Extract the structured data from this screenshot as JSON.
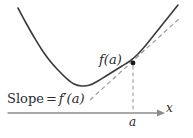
{
  "figure": {
    "width": 193,
    "height": 138,
    "background": "#ffffff",
    "curve_color": "#3a3a3a",
    "tangent_color": "#9a9a9a",
    "axis_color": "#8c8c8c",
    "dashed_drop_color": "#a0a0a0",
    "point_color": "#1a1a1a",
    "text_color": "#2b2b2b"
  },
  "labels": {
    "value_at_a": "f(a)",
    "slope_prefix": "Slope",
    "slope_equals": "=",
    "slope_value": "f′(a)",
    "slope_full": "Slope = f′(a)",
    "x_tick": "a",
    "axis_x": "x"
  },
  "chart_data": {
    "type": "line",
    "title": "",
    "subtitle": "",
    "xlabel": "x",
    "ylabel": "",
    "grid": false,
    "legend": null,
    "axis": {
      "x_axis_y_px": 113,
      "x_axis_start_px": 8,
      "x_axis_end_px": 162,
      "arrow": "right",
      "ticks": [
        {
          "label": "a",
          "x_px": 133
        }
      ]
    },
    "series": [
      {
        "name": "f(x)",
        "style": "solid",
        "color": "#3a3a3a",
        "description": "upward-opening parabola",
        "points_px": [
          [
            18,
            8
          ],
          [
            26,
            23
          ],
          [
            34,
            37
          ],
          [
            42,
            50
          ],
          [
            50,
            61
          ],
          [
            58,
            70
          ],
          [
            66,
            78
          ],
          [
            74,
            84
          ],
          [
            82,
            86
          ],
          [
            90,
            85
          ],
          [
            98,
            81
          ],
          [
            106,
            76
          ],
          [
            114,
            71
          ],
          [
            122,
            66
          ],
          [
            130,
            61
          ],
          [
            138,
            54
          ],
          [
            146,
            45
          ],
          [
            154,
            35
          ],
          [
            162,
            25
          ],
          [
            170,
            15
          ],
          [
            178,
            5
          ]
        ]
      },
      {
        "name": "tangent at a",
        "style": "dashed",
        "color": "#9a9a9a",
        "description": "tangent line touching curve at x = a with slope f'(a)",
        "points_px": [
          [
            90,
            100
          ],
          [
            181,
            17
          ]
        ]
      },
      {
        "name": "drop line at a",
        "style": "dashed",
        "color": "#a0a0a0",
        "description": "vertical dashed segment from tangent point down to x-axis",
        "points_px": [
          [
            133,
            66
          ],
          [
            133,
            113
          ]
        ]
      }
    ],
    "annotations": [
      {
        "text": "f(a)",
        "x_px": 99,
        "y_px": 53,
        "anchor": "left-top"
      },
      {
        "text": "Slope = f′(a)",
        "x_px": 7,
        "y_px": 92,
        "anchor": "left-top"
      },
      {
        "text": "a",
        "x_px": 129,
        "y_px": 116,
        "anchor": "left-top"
      },
      {
        "text": "x",
        "x_px": 166,
        "y_px": 102,
        "anchor": "left-top"
      }
    ],
    "markers": [
      {
        "name": "tangent-point",
        "x_px": 133,
        "y_px": 63,
        "radius_px": 2.4,
        "color": "#1a1a1a"
      }
    ]
  }
}
